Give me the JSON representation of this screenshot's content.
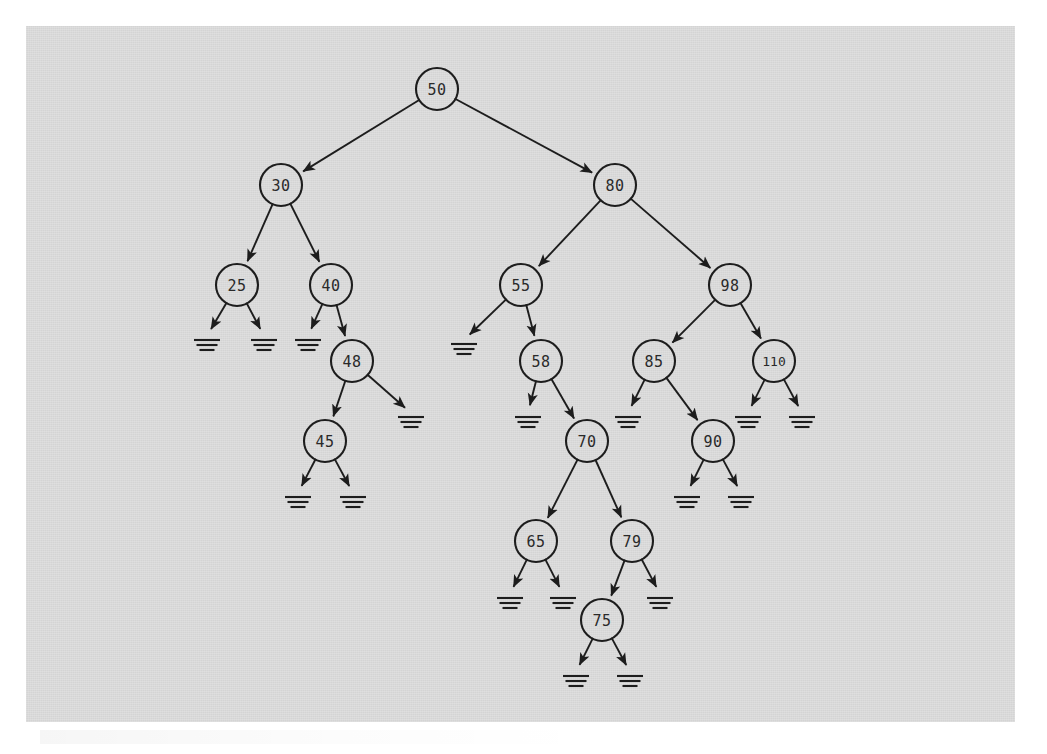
{
  "diagram": {
    "kind": "binary-search-tree",
    "background_color": "#d4d4d4",
    "page_color": "#ffffff",
    "ink_color": "#1d1d1d",
    "node_radius": 21,
    "null_symbol": "ground-triple-bar",
    "nodes": [
      {
        "id": "n50",
        "label": "50",
        "x": 437,
        "y": 89,
        "depth": 0
      },
      {
        "id": "n30",
        "label": "30",
        "x": 281,
        "y": 185,
        "depth": 1
      },
      {
        "id": "n80",
        "label": "80",
        "x": 615,
        "y": 185,
        "depth": 1
      },
      {
        "id": "n25",
        "label": "25",
        "x": 237,
        "y": 285,
        "depth": 2
      },
      {
        "id": "n40",
        "label": "40",
        "x": 331,
        "y": 285,
        "depth": 2
      },
      {
        "id": "n55",
        "label": "55",
        "x": 521,
        "y": 285,
        "depth": 2
      },
      {
        "id": "n98",
        "label": "98",
        "x": 730,
        "y": 285,
        "depth": 2
      },
      {
        "id": "n48",
        "label": "48",
        "x": 352,
        "y": 361,
        "depth": 3
      },
      {
        "id": "n58",
        "label": "58",
        "x": 541,
        "y": 361,
        "depth": 3
      },
      {
        "id": "n85",
        "label": "85",
        "x": 654,
        "y": 361,
        "depth": 3
      },
      {
        "id": "n110",
        "label": "110",
        "x": 774,
        "y": 361,
        "depth": 3
      },
      {
        "id": "n45",
        "label": "45",
        "x": 325,
        "y": 441,
        "depth": 4
      },
      {
        "id": "n70",
        "label": "70",
        "x": 587,
        "y": 441,
        "depth": 4
      },
      {
        "id": "n90",
        "label": "90",
        "x": 713,
        "y": 441,
        "depth": 4
      },
      {
        "id": "n65",
        "label": "65",
        "x": 536,
        "y": 541,
        "depth": 5
      },
      {
        "id": "n79",
        "label": "79",
        "x": 632,
        "y": 541,
        "depth": 5
      },
      {
        "id": "n75",
        "label": "75",
        "x": 602,
        "y": 620,
        "depth": 6
      }
    ],
    "edges": [
      {
        "from": "n50",
        "to": "n30",
        "side": "left"
      },
      {
        "from": "n50",
        "to": "n80",
        "side": "right"
      },
      {
        "from": "n30",
        "to": "n25",
        "side": "left"
      },
      {
        "from": "n30",
        "to": "n40",
        "side": "right"
      },
      {
        "from": "n40",
        "to": "n48",
        "side": "right"
      },
      {
        "from": "n48",
        "to": "n45",
        "side": "left"
      },
      {
        "from": "n80",
        "to": "n55",
        "side": "left"
      },
      {
        "from": "n80",
        "to": "n98",
        "side": "right"
      },
      {
        "from": "n55",
        "to": "n58",
        "side": "right"
      },
      {
        "from": "n58",
        "to": "n70",
        "side": "right"
      },
      {
        "from": "n70",
        "to": "n65",
        "side": "left"
      },
      {
        "from": "n70",
        "to": "n79",
        "side": "right"
      },
      {
        "from": "n79",
        "to": "n75",
        "side": "left"
      },
      {
        "from": "n98",
        "to": "n85",
        "side": "left"
      },
      {
        "from": "n98",
        "to": "n110",
        "side": "right"
      },
      {
        "from": "n85",
        "to": "n90",
        "side": "right"
      }
    ],
    "null_leaves": [
      {
        "id": "e25L",
        "parent": "n25",
        "side": "left",
        "x": 207,
        "y": 340
      },
      {
        "id": "e25R",
        "parent": "n25",
        "side": "right",
        "x": 264,
        "y": 340
      },
      {
        "id": "e40L",
        "parent": "n40",
        "side": "left",
        "x": 308,
        "y": 340
      },
      {
        "id": "e48R",
        "parent": "n48",
        "side": "right",
        "x": 411,
        "y": 417
      },
      {
        "id": "e45L",
        "parent": "n45",
        "side": "left",
        "x": 298,
        "y": 497
      },
      {
        "id": "e45R",
        "parent": "n45",
        "side": "right",
        "x": 353,
        "y": 497
      },
      {
        "id": "e55L",
        "parent": "n55",
        "side": "left",
        "x": 464,
        "y": 344
      },
      {
        "id": "e58L",
        "parent": "n58",
        "side": "left",
        "x": 528,
        "y": 417
      },
      {
        "id": "e65L",
        "parent": "n65",
        "side": "left",
        "x": 510,
        "y": 598
      },
      {
        "id": "e65R",
        "parent": "n65",
        "side": "right",
        "x": 563,
        "y": 598
      },
      {
        "id": "e79R",
        "parent": "n79",
        "side": "right",
        "x": 660,
        "y": 598
      },
      {
        "id": "e75L",
        "parent": "n75",
        "side": "left",
        "x": 576,
        "y": 676
      },
      {
        "id": "e75R",
        "parent": "n75",
        "side": "right",
        "x": 630,
        "y": 676
      },
      {
        "id": "e85L",
        "parent": "n85",
        "side": "left",
        "x": 628,
        "y": 417
      },
      {
        "id": "e90L",
        "parent": "n90",
        "side": "left",
        "x": 687,
        "y": 497
      },
      {
        "id": "e90R",
        "parent": "n90",
        "side": "right",
        "x": 741,
        "y": 497
      },
      {
        "id": "e110L",
        "parent": "n110",
        "side": "left",
        "x": 748,
        "y": 417
      },
      {
        "id": "e110R",
        "parent": "n110",
        "side": "right",
        "x": 802,
        "y": 417
      }
    ],
    "tree_structure": {
      "value": 50,
      "left": {
        "value": 30,
        "left": {
          "value": 25,
          "left": null,
          "right": null
        },
        "right": {
          "value": 40,
          "left": null,
          "right": {
            "value": 48,
            "left": {
              "value": 45,
              "left": null,
              "right": null
            },
            "right": null
          }
        }
      },
      "right": {
        "value": 80,
        "left": {
          "value": 55,
          "left": null,
          "right": {
            "value": 58,
            "left": null,
            "right": {
              "value": 70,
              "left": {
                "value": 65,
                "left": null,
                "right": null
              },
              "right": {
                "value": 79,
                "left": {
                  "value": 75,
                  "left": null,
                  "right": null
                },
                "right": null
              }
            }
          }
        },
        "right": {
          "value": 98,
          "left": {
            "value": 85,
            "left": null,
            "right": {
              "value": 90,
              "left": null,
              "right": null
            }
          },
          "right": {
            "value": 110,
            "left": null,
            "right": null
          }
        }
      }
    }
  }
}
